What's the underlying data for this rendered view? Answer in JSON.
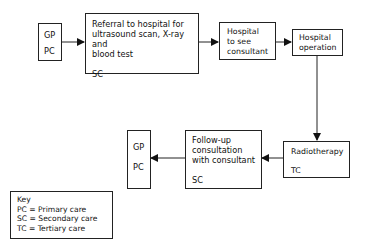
{
  "nodes": {
    "gp1": {
      "line1": "GP",
      "line2": "PC"
    },
    "referral": {
      "lines": [
        "Referral to hospital for",
        "ultrasound scan, X-ray and",
        "blood test"
      ],
      "care": "SC"
    },
    "hospital_consultant": {
      "lines": [
        "Hospital",
        "to see",
        "consultant"
      ]
    },
    "hospital_operation": {
      "lines": [
        "Hospital",
        "operation"
      ]
    },
    "radiotherapy": {
      "label": "Radiotherapy",
      "care": "TC"
    },
    "followup": {
      "lines": [
        "Follow-up",
        "consultation",
        "with consultant"
      ],
      "care": "SC"
    },
    "gp2": {
      "line1": "GP",
      "line2": "PC"
    }
  },
  "key": {
    "title": "Key",
    "items": [
      "PC = Primary care",
      "SC = Secondary care",
      "TC = Tertiary care"
    ]
  }
}
